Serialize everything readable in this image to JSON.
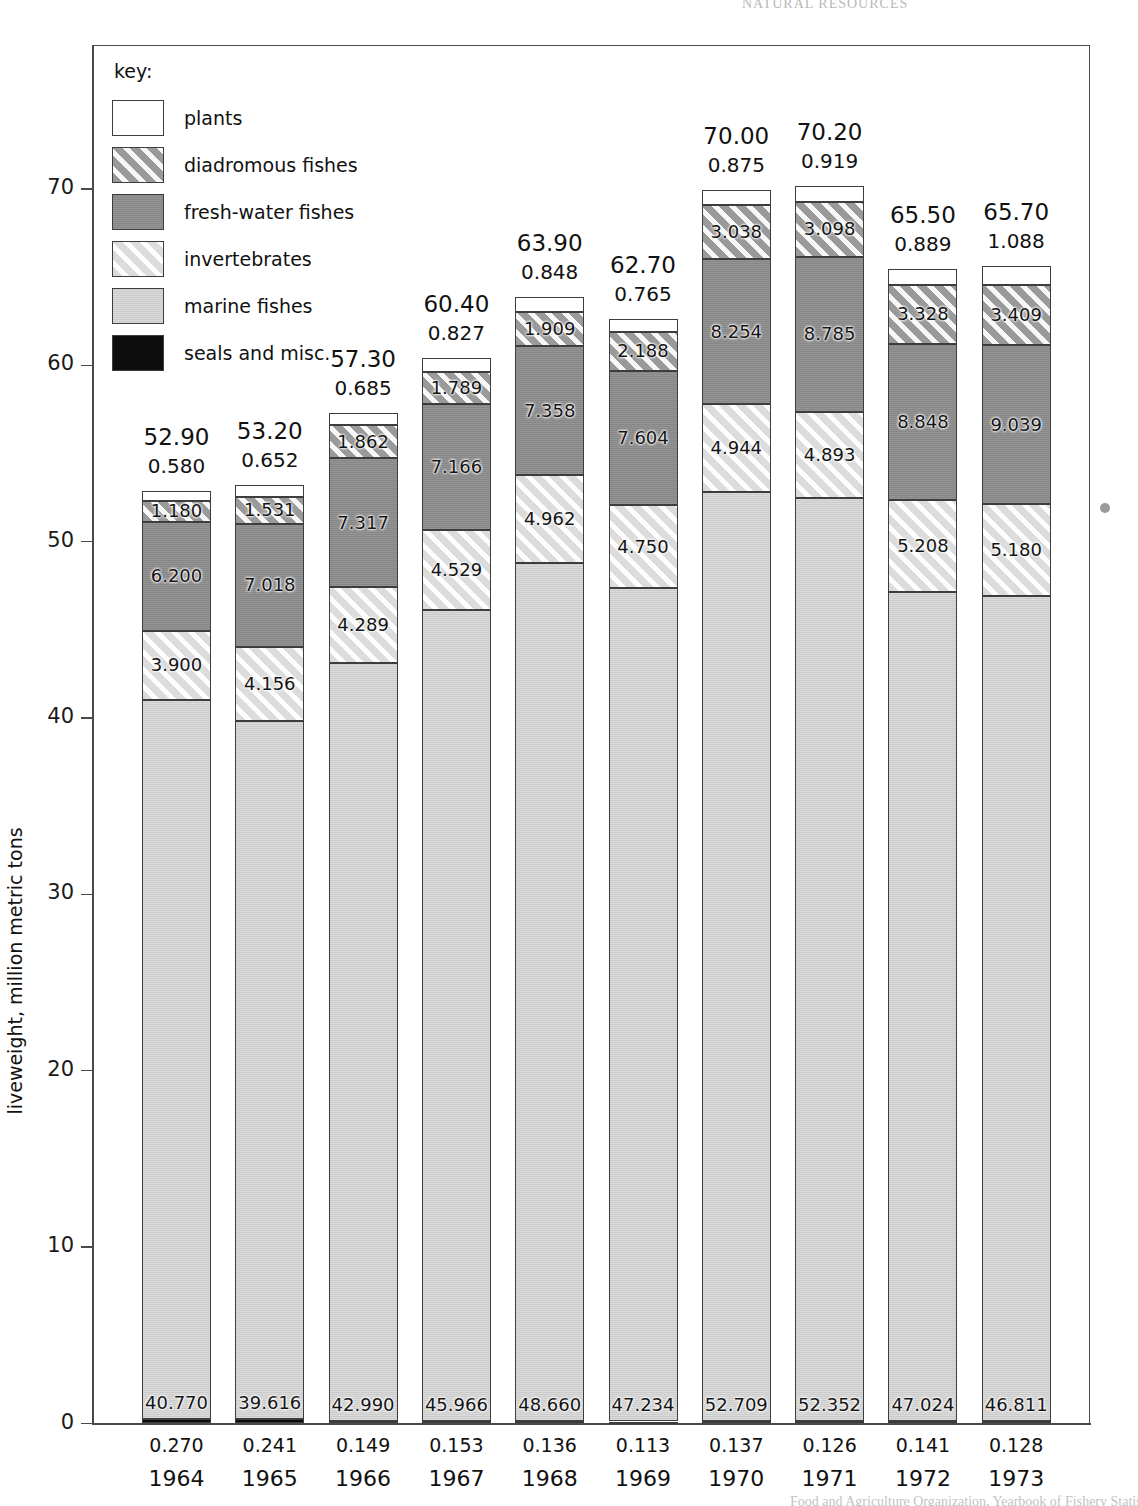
{
  "page": {
    "running_head": "NATURAL RESOURCES",
    "bottom_caption": "Food and Agriculture Organization, Yearbook of Fishery Statistics"
  },
  "axes": {
    "y_title": "liveweight, million metric tons",
    "y_ticks": [
      "0",
      "10",
      "20",
      "30",
      "40",
      "50",
      "60",
      "70"
    ],
    "y_min": 0,
    "y_max": 70
  },
  "legend": {
    "title": "key:",
    "items": [
      {
        "label": "plants",
        "swatch": "white-box",
        "color": "#ffffff"
      },
      {
        "label": "diadromous fishes",
        "swatch": "hatched-mid-gray-box",
        "color": "#9a9a9a"
      },
      {
        "label": "fresh-water fishes",
        "swatch": "solid-mid-gray-box",
        "color": "#8e8e8e"
      },
      {
        "label": "invertebrates",
        "swatch": "hatched-light-gray-box",
        "color": "#dcdcdc"
      },
      {
        "label": "marine fishes",
        "swatch": "solid-light-gray-box",
        "color": "#d6d6d6"
      },
      {
        "label": "seals and misc.",
        "swatch": "black-box",
        "color": "#0d0d0d"
      }
    ]
  },
  "chart_data": {
    "type": "bar",
    "stacked": true,
    "title": "",
    "xlabel": "",
    "ylabel": "liveweight, million metric tons",
    "ylim": [
      0,
      70
    ],
    "grid": true,
    "legend_position": "inside-top-left",
    "categories": [
      "1964",
      "1965",
      "1966",
      "1967",
      "1968",
      "1969",
      "1970",
      "1971",
      "1972",
      "1973"
    ],
    "totals": [
      "52.90",
      "53.20",
      "57.30",
      "60.40",
      "63.90",
      "62.70",
      "70.00",
      "70.20",
      "65.50",
      "65.70"
    ],
    "series": [
      {
        "name": "seals and misc.",
        "values": [
          0.27,
          0.241,
          0.149,
          0.153,
          0.136,
          0.113,
          0.137,
          0.126,
          0.141,
          0.128
        ],
        "labels": [
          "0.270",
          "0.241",
          "0.149",
          "0.153",
          "0.136",
          "0.113",
          "0.137",
          "0.126",
          "0.141",
          "0.128"
        ],
        "label_position": "below-axis"
      },
      {
        "name": "marine fishes",
        "values": [
          40.77,
          39.616,
          42.99,
          45.966,
          48.66,
          47.234,
          52.709,
          52.352,
          47.024,
          46.811
        ],
        "labels": [
          "40.770",
          "39.616",
          "42.990",
          "45.966",
          "48.660",
          "47.234",
          "52.709",
          "52.352",
          "47.024",
          "46.811"
        ]
      },
      {
        "name": "invertebrates",
        "values": [
          3.9,
          4.156,
          4.289,
          4.529,
          4.962,
          4.75,
          4.944,
          4.893,
          5.208,
          5.18
        ],
        "labels": [
          "3.900",
          "4.156",
          "4.289",
          "4.529",
          "4.962",
          "4.750",
          "4.944",
          "4.893",
          "5.208",
          "5.180"
        ]
      },
      {
        "name": "fresh-water fishes",
        "values": [
          6.2,
          7.018,
          7.317,
          7.166,
          7.358,
          7.604,
          8.254,
          8.785,
          8.848,
          9.039
        ],
        "labels": [
          "6.200",
          "7.018",
          "7.317",
          "7.166",
          "7.358",
          "7.604",
          "8.254",
          "8.785",
          "8.848",
          "9.039"
        ]
      },
      {
        "name": "diadromous fishes",
        "values": [
          1.18,
          1.531,
          1.862,
          1.789,
          1.909,
          2.188,
          3.038,
          3.098,
          3.328,
          3.409
        ],
        "labels": [
          "1.180",
          "1.531",
          "1.862",
          "1.789",
          "1.909",
          "2.188",
          "3.038",
          "3.098",
          "3.328",
          "3.409"
        ]
      },
      {
        "name": "plants",
        "values": [
          0.58,
          0.652,
          0.685,
          0.827,
          0.848,
          0.765,
          0.875,
          0.919,
          0.889,
          1.088
        ],
        "labels": [
          "0.580",
          "0.652",
          "0.685",
          "0.827",
          "0.848",
          "0.765",
          "0.875",
          "0.919",
          "0.889",
          "1.088"
        ],
        "label_position": "above-bar"
      }
    ]
  }
}
